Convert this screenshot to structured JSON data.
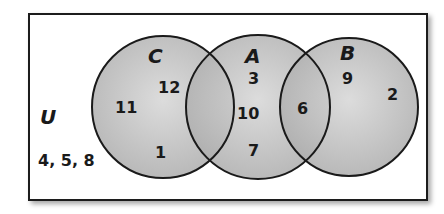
{
  "diagram": {
    "type": "venn",
    "universe": {
      "label": "U",
      "outside_elements": "4, 5, 8"
    },
    "sets": [
      {
        "name": "C",
        "cx": 163,
        "cy": 107,
        "r": 71
      },
      {
        "name": "A",
        "cx": 258,
        "cy": 107,
        "r": 72
      },
      {
        "name": "B",
        "cx": 349,
        "cy": 107,
        "r": 69
      }
    ],
    "regions": {
      "C_only": [
        "11",
        "12",
        "1"
      ],
      "A_only": [
        "3",
        "10",
        "7"
      ],
      "A_and_B": [
        "6"
      ],
      "B_only": [
        "9",
        "2"
      ],
      "C_and_A": []
    },
    "colors": {
      "frame_stroke": "#1a1a1a",
      "circle_fill": "#bdbdbd",
      "circle_stroke": "#1a1a1a",
      "text": "#1a1a1a"
    }
  }
}
